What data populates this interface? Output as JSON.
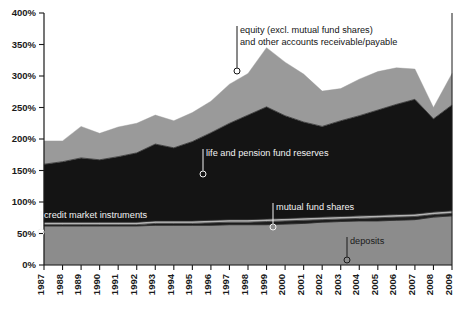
{
  "chart_data": {
    "type": "area",
    "stacked": true,
    "title": "",
    "subtitle": "",
    "xlabel": "",
    "ylabel": "",
    "ylim": [
      0,
      400
    ],
    "yunit": "%",
    "ytick_labels": [
      "0%",
      "50%",
      "100%",
      "150%",
      "200%",
      "250%",
      "300%",
      "350%",
      "400%"
    ],
    "ytick_values": [
      0,
      50,
      100,
      150,
      200,
      250,
      300,
      350,
      400
    ],
    "grid": false,
    "legend_position": "inline-annotations",
    "x": [
      1987,
      1988,
      1989,
      1990,
      1991,
      1992,
      1993,
      1994,
      1995,
      1996,
      1997,
      1998,
      1999,
      2000,
      2001,
      2002,
      2003,
      2004,
      2005,
      2006,
      2007,
      2008,
      2009
    ],
    "xtick_labels": [
      "1987",
      "1988",
      "1989",
      "1990",
      "1991",
      "1992",
      "1993",
      "1994",
      "1995",
      "1996",
      "1997",
      "1998",
      "1999",
      "2000",
      "2001",
      "2002",
      "2003",
      "2004",
      "2005",
      "2006",
      "2007",
      "2008",
      "2009"
    ],
    "series": [
      {
        "name": "deposits",
        "color": "#8c8c8c",
        "values": [
          62,
          62,
          62,
          62,
          62,
          62,
          63,
          63,
          63,
          63,
          64,
          64,
          64,
          65,
          66,
          68,
          69,
          70,
          70,
          71,
          72,
          76,
          78
        ]
      },
      {
        "name": "mutual fund shares",
        "color": "#1c1c1c",
        "values": [
          2,
          2,
          2,
          2,
          2,
          2,
          3,
          3,
          3,
          4,
          4,
          4,
          5,
          5,
          5,
          4,
          4,
          4,
          5,
          5,
          5,
          4,
          4
        ]
      },
      {
        "name": "credit market instruments",
        "color": "#b5b5b5",
        "values": [
          4,
          4,
          4,
          4,
          4,
          4,
          4,
          4,
          4,
          4,
          4,
          4,
          4,
          4,
          4,
          4,
          4,
          4,
          4,
          4,
          4,
          4,
          4
        ]
      },
      {
        "name": "life and pension fund reserves",
        "color": "#141414",
        "values": [
          92,
          96,
          102,
          99,
          104,
          110,
          122,
          116,
          126,
          139,
          153,
          166,
          178,
          163,
          152,
          144,
          152,
          159,
          167,
          175,
          182,
          148,
          168
        ]
      },
      {
        "name": "equity (excl. mutual fund shares) and other accounts receivable/payable",
        "color": "#9a9a9a",
        "values": [
          37,
          33,
          50,
          42,
          47,
          47,
          46,
          43,
          46,
          50,
          62,
          66,
          94,
          85,
          76,
          56,
          51,
          58,
          61,
          58,
          48,
          18,
          50
        ]
      }
    ],
    "totals": [
      197,
      197,
      220,
      209,
      219,
      225,
      238,
      229,
      242,
      260,
      287,
      304,
      345,
      322,
      303,
      276,
      280,
      295,
      307,
      313,
      311,
      250,
      304
    ],
    "annotations": [
      {
        "name": "equity-annotation",
        "lines": [
          "equity (excl. mutual fund shares)",
          "and other accounts receivable/payable"
        ],
        "marker_year": 1999,
        "marker_value": 302,
        "text_color": "#141414"
      },
      {
        "name": "life-pension-annotation",
        "lines": [
          "life and pension fund reserves"
        ],
        "marker_year": 1996,
        "marker_value": 152,
        "text_color": "#f2f2f2"
      },
      {
        "name": "mutual-fund-annotation",
        "lines": [
          "mutual fund shares"
        ],
        "marker_year": 2000,
        "marker_value": 71,
        "text_color": "#f2f2f2"
      },
      {
        "name": "credit-market-annotation",
        "lines": [
          "credit market instruments"
        ],
        "marker_year": 1987,
        "marker_value": 66,
        "text_color": "#f2f2f2"
      },
      {
        "name": "deposits-annotation",
        "lines": [
          "deposits"
        ],
        "marker_year": 2003,
        "marker_value": 40,
        "text_color": "#1a1a1a"
      }
    ]
  }
}
